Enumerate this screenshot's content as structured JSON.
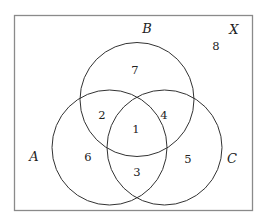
{
  "diagram": {
    "type": "venn",
    "universe": {
      "label": "X",
      "region_number": "8"
    },
    "sets": [
      {
        "label": "A"
      },
      {
        "label": "B"
      },
      {
        "label": "C"
      }
    ],
    "regions": {
      "A_and_B_and_C": "1",
      "A_and_B_only": "2",
      "A_and_C_only": "3",
      "B_and_C_only": "4",
      "C_only": "5",
      "A_only": "6",
      "B_only": "7",
      "outside": "8"
    },
    "colors": {
      "stroke": "#333333",
      "border": "#888888",
      "background": "#ffffff"
    }
  }
}
